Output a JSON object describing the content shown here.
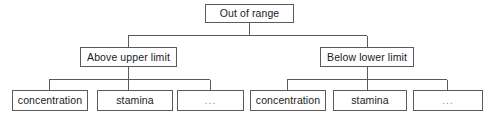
{
  "diagram": {
    "type": "tree",
    "title_text": "Out of range",
    "background_color": "#ffffff",
    "border_color": "#5a5a5a",
    "text_color": "#1b1b1b",
    "muted_text_color": "#8d8d8d",
    "root": {
      "label": "Out of range",
      "x": 205,
      "y": 4,
      "w": 89,
      "h": 19
    },
    "level2": [
      {
        "label": "Above upper limit",
        "x": 80,
        "y": 47,
        "w": 97,
        "h": 20
      },
      {
        "label": "Below lower limit",
        "x": 320,
        "y": 47,
        "w": 94,
        "h": 20
      }
    ],
    "leaves": [
      {
        "label": "concentration",
        "x": 12,
        "y": 90,
        "w": 76,
        "h": 21,
        "muted": false
      },
      {
        "label": "stamina",
        "x": 97,
        "y": 90,
        "w": 76,
        "h": 21,
        "muted": false
      },
      {
        "label": "...",
        "x": 177,
        "y": 90,
        "w": 67,
        "h": 21,
        "muted": true
      },
      {
        "label": "concentration",
        "x": 250,
        "y": 90,
        "w": 76,
        "h": 21,
        "muted": false
      },
      {
        "label": "stamina",
        "x": 333,
        "y": 90,
        "w": 74,
        "h": 21,
        "muted": false
      },
      {
        "label": "...",
        "x": 413,
        "y": 90,
        "w": 70,
        "h": 21,
        "muted": true
      }
    ],
    "connectors": {
      "root_stem": {
        "x": 249,
        "y1": 23,
        "y2": 35
      },
      "root_bar": {
        "y": 35,
        "x1": 128,
        "x2": 367
      },
      "root_drops": [
        {
          "x": 128,
          "y1": 35,
          "y2": 47
        },
        {
          "x": 367,
          "y1": 35,
          "y2": 47
        }
      ],
      "left_stem": {
        "x": 128,
        "y1": 67,
        "y2": 79
      },
      "left_bar": {
        "y": 79,
        "x1": 49,
        "x2": 210
      },
      "left_drops": [
        {
          "x": 49,
          "y1": 79,
          "y2": 90
        },
        {
          "x": 128,
          "y1": 79,
          "y2": 90
        },
        {
          "x": 210,
          "y1": 79,
          "y2": 90
        }
      ],
      "right_stem": {
        "x": 367,
        "y1": 67,
        "y2": 79
      },
      "right_bar": {
        "y": 79,
        "x1": 287,
        "x2": 447
      },
      "right_drops": [
        {
          "x": 287,
          "y1": 79,
          "y2": 90
        },
        {
          "x": 367,
          "y1": 79,
          "y2": 90
        },
        {
          "x": 447,
          "y1": 79,
          "y2": 90
        }
      ]
    }
  }
}
